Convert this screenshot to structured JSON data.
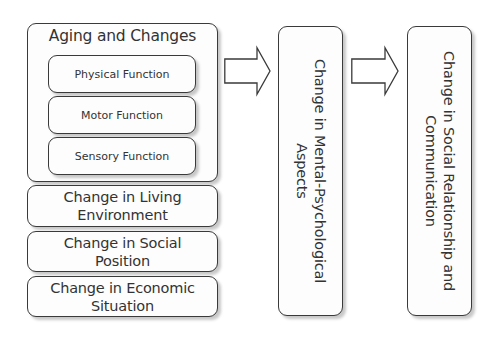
{
  "diagram": {
    "aging_group": {
      "title": "Aging and Changes",
      "items": [
        {
          "label": "Physical Function"
        },
        {
          "label": "Motor Function"
        },
        {
          "label": "Sensory Function"
        }
      ]
    },
    "factors": [
      {
        "line1": "Change in Living",
        "line2": "Environment"
      },
      {
        "line1": "Change in Social",
        "line2": "Position"
      },
      {
        "line1": "Change in Economic",
        "line2": "Situation"
      }
    ],
    "middle": {
      "line1": "Change in Mental-Psychological",
      "line2": "Aspects"
    },
    "result": {
      "line1": "Change in Social Relationship and",
      "line2": "Communication"
    },
    "arrows": [
      {
        "from": "causes",
        "to": "middle",
        "icon": "right-block-arrow-icon"
      },
      {
        "from": "middle",
        "to": "result",
        "icon": "right-block-arrow-icon"
      }
    ],
    "colors": {
      "stroke": "#3a3a3a",
      "fill": "#fdfdfd",
      "text": "#333333"
    }
  }
}
